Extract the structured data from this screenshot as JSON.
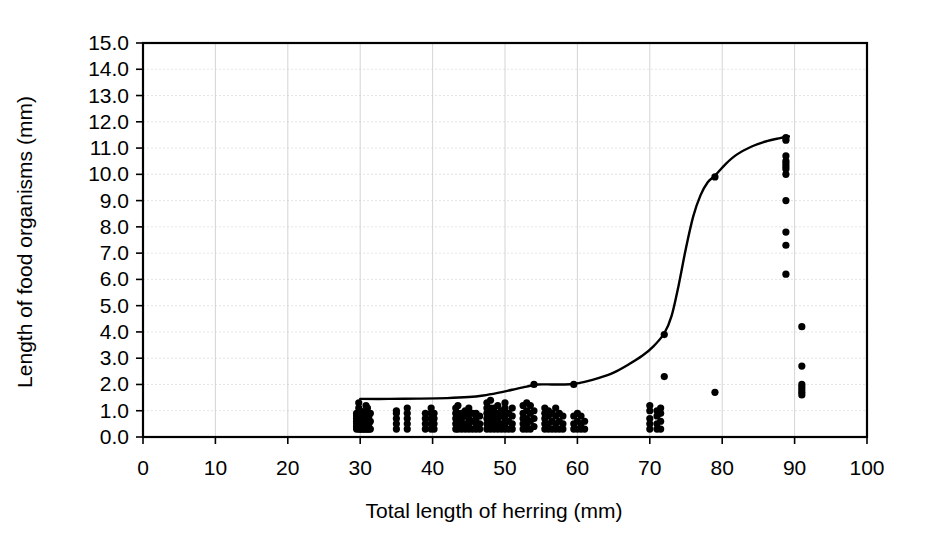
{
  "chart_data": {
    "type": "scatter",
    "title": "",
    "xlabel": "Total length of herring (mm)",
    "ylabel": "Length of food organisms (mm)",
    "xlim": [
      0,
      100
    ],
    "ylim": [
      0,
      15
    ],
    "xticks": [
      0,
      10,
      20,
      30,
      40,
      50,
      60,
      70,
      80,
      90,
      100
    ],
    "xtick_labels": [
      "0",
      "10",
      "20",
      "30",
      "40",
      "50",
      "60",
      "70",
      "80",
      "90",
      "100"
    ],
    "yticks": [
      0,
      1,
      2,
      3,
      4,
      5,
      6,
      7,
      8,
      9,
      10,
      11,
      12,
      13,
      14,
      15
    ],
    "ytick_labels": [
      "0.0",
      "1.0",
      "2.0",
      "3.0",
      "4.0",
      "5.0",
      "6.0",
      "7.0",
      "8.0",
      "9.0",
      "10.0",
      "11.0",
      "12.0",
      "13.0",
      "14.0",
      "15.0"
    ],
    "grid": true,
    "legend": false,
    "legend_position": "none",
    "marker_color": "#000000",
    "curve_color": "#000000",
    "series": [
      {
        "name": "Observations",
        "type": "scatter",
        "points": [
          [
            29.5,
            0.3
          ],
          [
            29.5,
            0.4
          ],
          [
            29.5,
            0.5
          ],
          [
            29.5,
            0.6
          ],
          [
            29.5,
            0.7
          ],
          [
            29.5,
            0.8
          ],
          [
            29.5,
            0.9
          ],
          [
            29.8,
            0.3
          ],
          [
            29.8,
            0.5
          ],
          [
            29.8,
            0.7
          ],
          [
            29.8,
            1.1
          ],
          [
            29.8,
            1.3
          ],
          [
            30.0,
            0.3
          ],
          [
            30.0,
            0.4
          ],
          [
            30.0,
            0.5
          ],
          [
            30.0,
            0.6
          ],
          [
            30.0,
            0.7
          ],
          [
            30.0,
            0.8
          ],
          [
            30.0,
            0.9
          ],
          [
            30.0,
            1.0
          ],
          [
            30.2,
            0.3
          ],
          [
            30.2,
            0.5
          ],
          [
            30.2,
            0.7
          ],
          [
            30.2,
            0.9
          ],
          [
            30.4,
            0.3
          ],
          [
            30.4,
            0.4
          ],
          [
            30.4,
            0.6
          ],
          [
            30.4,
            0.8
          ],
          [
            30.6,
            0.3
          ],
          [
            30.6,
            0.5
          ],
          [
            30.6,
            0.7
          ],
          [
            30.6,
            0.9
          ],
          [
            30.8,
            0.3
          ],
          [
            30.8,
            0.4
          ],
          [
            30.8,
            0.6
          ],
          [
            30.8,
            1.0
          ],
          [
            30.8,
            1.2
          ],
          [
            31.0,
            0.3
          ],
          [
            31.0,
            0.5
          ],
          [
            31.0,
            0.7
          ],
          [
            31.0,
            0.9
          ],
          [
            31.0,
            1.1
          ],
          [
            31.2,
            0.3
          ],
          [
            31.2,
            0.5
          ],
          [
            31.2,
            0.8
          ],
          [
            31.4,
            0.3
          ],
          [
            31.4,
            0.6
          ],
          [
            31.4,
            0.9
          ],
          [
            35.0,
            0.3
          ],
          [
            35.0,
            0.5
          ],
          [
            35.0,
            0.7
          ],
          [
            35.0,
            0.9
          ],
          [
            35.0,
            1.0
          ],
          [
            36.5,
            0.3
          ],
          [
            36.5,
            0.5
          ],
          [
            36.5,
            0.7
          ],
          [
            36.5,
            0.9
          ],
          [
            36.5,
            1.1
          ],
          [
            39.0,
            0.3
          ],
          [
            39.0,
            0.5
          ],
          [
            39.0,
            0.7
          ],
          [
            39.0,
            0.9
          ],
          [
            39.8,
            0.3
          ],
          [
            39.8,
            0.5
          ],
          [
            39.8,
            0.7
          ],
          [
            39.8,
            0.9
          ],
          [
            39.8,
            1.1
          ],
          [
            40.2,
            0.3
          ],
          [
            40.2,
            0.5
          ],
          [
            40.2,
            0.7
          ],
          [
            40.2,
            0.9
          ],
          [
            43.2,
            0.3
          ],
          [
            43.2,
            0.5
          ],
          [
            43.2,
            0.7
          ],
          [
            43.2,
            0.9
          ],
          [
            43.2,
            1.1
          ],
          [
            43.5,
            0.3
          ],
          [
            43.5,
            0.6
          ],
          [
            43.5,
            0.9
          ],
          [
            43.5,
            1.2
          ],
          [
            44.0,
            0.3
          ],
          [
            44.0,
            0.5
          ],
          [
            44.0,
            0.7
          ],
          [
            44.0,
            0.9
          ],
          [
            44.5,
            0.3
          ],
          [
            44.5,
            0.5
          ],
          [
            44.5,
            0.8
          ],
          [
            44.5,
            1.0
          ],
          [
            45.0,
            0.3
          ],
          [
            45.0,
            0.5
          ],
          [
            45.0,
            0.7
          ],
          [
            45.0,
            0.9
          ],
          [
            45.0,
            1.1
          ],
          [
            45.5,
            0.3
          ],
          [
            45.5,
            0.6
          ],
          [
            45.5,
            0.9
          ],
          [
            46.0,
            0.3
          ],
          [
            46.0,
            0.5
          ],
          [
            46.0,
            0.7
          ],
          [
            46.0,
            0.9
          ],
          [
            46.5,
            0.3
          ],
          [
            46.5,
            0.5
          ],
          [
            46.5,
            0.8
          ],
          [
            47.5,
            0.3
          ],
          [
            47.5,
            0.5
          ],
          [
            47.5,
            0.7
          ],
          [
            47.5,
            0.9
          ],
          [
            47.5,
            1.1
          ],
          [
            47.5,
            1.3
          ],
          [
            48.0,
            0.3
          ],
          [
            48.0,
            0.5
          ],
          [
            48.0,
            0.7
          ],
          [
            48.0,
            0.9
          ],
          [
            48.0,
            1.1
          ],
          [
            48.0,
            1.4
          ],
          [
            48.5,
            0.3
          ],
          [
            48.5,
            0.5
          ],
          [
            48.5,
            0.7
          ],
          [
            48.5,
            0.9
          ],
          [
            48.5,
            1.1
          ],
          [
            49.0,
            0.3
          ],
          [
            49.0,
            0.5
          ],
          [
            49.0,
            0.7
          ],
          [
            49.0,
            0.9
          ],
          [
            49.0,
            1.2
          ],
          [
            49.5,
            0.3
          ],
          [
            49.5,
            0.5
          ],
          [
            49.5,
            0.8
          ],
          [
            49.5,
            1.0
          ],
          [
            50.0,
            0.3
          ],
          [
            50.0,
            0.5
          ],
          [
            50.0,
            0.7
          ],
          [
            50.0,
            0.9
          ],
          [
            50.0,
            1.1
          ],
          [
            50.0,
            1.3
          ],
          [
            50.5,
            0.3
          ],
          [
            50.5,
            0.6
          ],
          [
            50.5,
            0.9
          ],
          [
            51.0,
            0.3
          ],
          [
            51.0,
            0.5
          ],
          [
            51.0,
            0.8
          ],
          [
            51.0,
            1.1
          ],
          [
            52.5,
            0.3
          ],
          [
            52.5,
            0.5
          ],
          [
            52.5,
            0.7
          ],
          [
            52.5,
            0.9
          ],
          [
            52.5,
            1.2
          ],
          [
            53.0,
            0.3
          ],
          [
            53.0,
            0.5
          ],
          [
            53.0,
            0.7
          ],
          [
            53.0,
            1.0
          ],
          [
            53.0,
            1.3
          ],
          [
            53.5,
            0.3
          ],
          [
            53.5,
            0.6
          ],
          [
            53.5,
            0.9
          ],
          [
            53.5,
            1.2
          ],
          [
            54.0,
            0.4
          ],
          [
            54.0,
            0.7
          ],
          [
            54.0,
            1.0
          ],
          [
            54.0,
            2.0
          ],
          [
            55.5,
            0.3
          ],
          [
            55.5,
            0.5
          ],
          [
            55.5,
            0.7
          ],
          [
            55.5,
            0.9
          ],
          [
            55.5,
            1.1
          ],
          [
            56.0,
            0.3
          ],
          [
            56.0,
            0.5
          ],
          [
            56.0,
            0.8
          ],
          [
            56.0,
            1.0
          ],
          [
            56.5,
            0.3
          ],
          [
            56.5,
            0.6
          ],
          [
            56.5,
            0.9
          ],
          [
            57.0,
            0.3
          ],
          [
            57.0,
            0.5
          ],
          [
            57.0,
            0.8
          ],
          [
            57.0,
            1.1
          ],
          [
            57.5,
            0.3
          ],
          [
            57.5,
            0.6
          ],
          [
            57.5,
            0.9
          ],
          [
            58.0,
            0.3
          ],
          [
            58.0,
            0.5
          ],
          [
            58.0,
            0.8
          ],
          [
            59.5,
            0.3
          ],
          [
            59.5,
            0.5
          ],
          [
            59.5,
            0.8
          ],
          [
            59.5,
            2.0
          ],
          [
            60.0,
            0.3
          ],
          [
            60.0,
            0.6
          ],
          [
            60.0,
            0.9
          ],
          [
            60.5,
            0.3
          ],
          [
            60.5,
            0.5
          ],
          [
            60.5,
            0.8
          ],
          [
            61.0,
            0.3
          ],
          [
            61.0,
            0.6
          ],
          [
            70.0,
            0.3
          ],
          [
            70.0,
            0.5
          ],
          [
            70.0,
            0.7
          ],
          [
            70.0,
            1.0
          ],
          [
            70.0,
            1.2
          ],
          [
            71.0,
            0.3
          ],
          [
            71.0,
            0.5
          ],
          [
            71.0,
            0.8
          ],
          [
            71.0,
            1.0
          ],
          [
            71.5,
            0.3
          ],
          [
            71.5,
            0.6
          ],
          [
            71.5,
            0.9
          ],
          [
            71.5,
            1.1
          ],
          [
            72.0,
            2.3
          ],
          [
            72.0,
            3.9
          ],
          [
            79.0,
            1.7
          ],
          [
            79.0,
            9.9
          ],
          [
            88.8,
            10.0
          ],
          [
            88.8,
            10.2
          ],
          [
            88.8,
            10.3
          ],
          [
            88.8,
            10.4
          ],
          [
            88.8,
            10.5
          ],
          [
            88.8,
            10.7
          ],
          [
            88.8,
            11.3
          ],
          [
            88.8,
            11.4
          ],
          [
            88.8,
            9.0
          ],
          [
            88.8,
            7.8
          ],
          [
            88.8,
            7.3
          ],
          [
            88.8,
            6.2
          ],
          [
            91.0,
            4.2
          ],
          [
            91.0,
            2.7
          ],
          [
            91.0,
            2.0
          ],
          [
            91.0,
            1.9
          ],
          [
            91.0,
            1.8
          ],
          [
            91.0,
            1.7
          ],
          [
            91.0,
            1.6
          ]
        ]
      },
      {
        "name": "Fitted curve",
        "type": "line",
        "points": [
          [
            30.0,
            1.45
          ],
          [
            34.0,
            1.45
          ],
          [
            38.0,
            1.46
          ],
          [
            42.0,
            1.48
          ],
          [
            45.0,
            1.52
          ],
          [
            47.0,
            1.58
          ],
          [
            49.0,
            1.68
          ],
          [
            51.0,
            1.8
          ],
          [
            53.0,
            1.92
          ],
          [
            54.5,
            2.0
          ],
          [
            56.5,
            2.0
          ],
          [
            58.0,
            2.0
          ],
          [
            59.5,
            2.02
          ],
          [
            61.0,
            2.1
          ],
          [
            63.0,
            2.25
          ],
          [
            65.0,
            2.45
          ],
          [
            67.0,
            2.75
          ],
          [
            69.0,
            3.1
          ],
          [
            70.5,
            3.45
          ],
          [
            72.0,
            3.95
          ],
          [
            73.0,
            4.6
          ],
          [
            74.0,
            5.8
          ],
          [
            75.0,
            7.2
          ],
          [
            76.0,
            8.4
          ],
          [
            77.0,
            9.2
          ],
          [
            78.0,
            9.7
          ],
          [
            79.0,
            9.95
          ],
          [
            80.5,
            10.4
          ],
          [
            82.0,
            10.75
          ],
          [
            84.0,
            11.05
          ],
          [
            86.0,
            11.25
          ],
          [
            88.0,
            11.38
          ],
          [
            89.2,
            11.45
          ]
        ]
      }
    ]
  },
  "axis_labels": {
    "x_title": "Total length of herring (mm)",
    "y_title": "Length of food organisms (mm)"
  }
}
